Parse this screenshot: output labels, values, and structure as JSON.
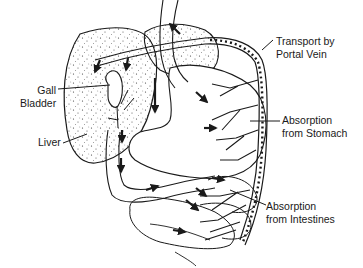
{
  "diagram": {
    "title": "",
    "labels": {
      "transport_portal_vein": {
        "line1": "Transport by",
        "line2": "Portal Vein"
      },
      "gall_bladder": {
        "line1": "Gall",
        "line2": "Bladder"
      },
      "liver": {
        "line1": "Liver"
      },
      "absorption_stomach": {
        "line1": "Absorption",
        "line2": "from Stomach"
      },
      "absorption_intestines": {
        "line1": "Absorption",
        "line2": "from Intestines"
      }
    },
    "colors": {
      "ink": "#1a1a1a",
      "background": "#ffffff"
    }
  }
}
